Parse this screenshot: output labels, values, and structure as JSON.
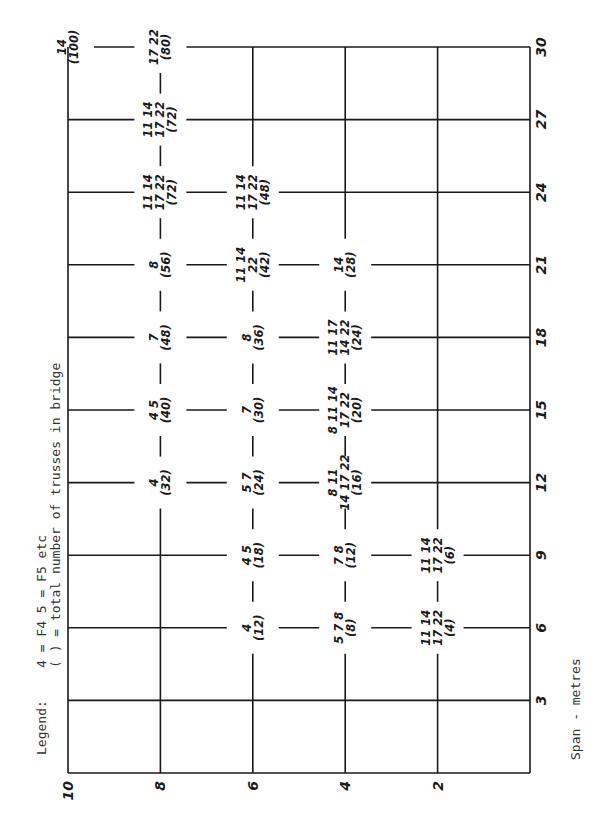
{
  "chart_data": {
    "type": "table",
    "orientation": "rotated-90-ccw",
    "legend": {
      "line1_key": "Legend:",
      "line1": "4 = F4     5 = F5  etc",
      "line2": "(  )  =  total number of trusses in bridge"
    },
    "xlabel": "Span - metres",
    "x_ticks": [
      3,
      6,
      9,
      12,
      15,
      18,
      21,
      24,
      27,
      30
    ],
    "xlim": [
      0,
      30
    ],
    "ylabel": "",
    "y_ticks": [
      2,
      4,
      6,
      8,
      10
    ],
    "ylim": [
      0,
      10
    ],
    "grid": true,
    "points": [
      {
        "span": 30,
        "y": 10,
        "types": "14",
        "total": "(100)"
      },
      {
        "span": 30,
        "y": 8,
        "types": "17 22",
        "total": "(80)"
      },
      {
        "span": 27,
        "y": 8,
        "types": "11 14 / 17 22",
        "total": "(72)"
      },
      {
        "span": 24,
        "y": 8,
        "types": "11 14 / 17 22",
        "total": "(72)"
      },
      {
        "span": 21,
        "y": 8,
        "types": "8",
        "total": "(56)"
      },
      {
        "span": 18,
        "y": 8,
        "types": "7",
        "total": "(48)"
      },
      {
        "span": 15,
        "y": 8,
        "types": "4 5",
        "total": "(40)"
      },
      {
        "span": 12,
        "y": 8,
        "types": "4",
        "total": "(32)"
      },
      {
        "span": 24,
        "y": 6,
        "types": "11 14 / 17 22",
        "total": "(48)"
      },
      {
        "span": 21,
        "y": 6,
        "types": "11 14 / 22",
        "total": "(42)"
      },
      {
        "span": 18,
        "y": 6,
        "types": "8",
        "total": "(36)"
      },
      {
        "span": 15,
        "y": 6,
        "types": "7",
        "total": "(30)"
      },
      {
        "span": 12,
        "y": 6,
        "types": "5 7",
        "total": "(24)"
      },
      {
        "span": 9,
        "y": 6,
        "types": "4 5",
        "total": "(18)"
      },
      {
        "span": 6,
        "y": 6,
        "types": "4",
        "total": "(12)"
      },
      {
        "span": 21,
        "y": 4,
        "types": "14",
        "total": "(28)"
      },
      {
        "span": 18,
        "y": 4,
        "types": "11 17 / 14 22",
        "total": "(24)"
      },
      {
        "span": 15,
        "y": 4,
        "types": "8 11 14 / 17 22",
        "total": "(20)"
      },
      {
        "span": 12,
        "y": 4,
        "types": "8 11 / 14 17 22",
        "total": "(16)"
      },
      {
        "span": 9,
        "y": 4,
        "types": "7 8",
        "total": "(12)"
      },
      {
        "span": 6,
        "y": 4,
        "types": "5 7 8",
        "total": "(8)"
      },
      {
        "span": 9,
        "y": 2,
        "types": "11 14 / 17 22",
        "total": "(6)"
      },
      {
        "span": 6,
        "y": 2,
        "types": "11 14 / 17 22",
        "total": "(4)"
      }
    ]
  }
}
